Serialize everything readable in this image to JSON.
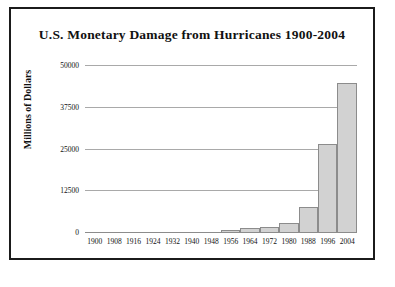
{
  "frame": {
    "border_color": "#1b1b1b",
    "background": "#ffffff"
  },
  "chart_data": {
    "type": "bar",
    "title": "U.S. Monetary Damage from Hurricanes 1900-2004",
    "xlabel": "",
    "ylabel": "Millions of Dollars",
    "ylim": [
      0,
      50000
    ],
    "yticks": [
      0,
      12500,
      25000,
      37500,
      50000
    ],
    "ytick_labels": [
      "0",
      "12500",
      "25000",
      "37500",
      "50000"
    ],
    "grid": true,
    "legend": "none",
    "bar_color": "#d2d2d2",
    "bar_edge_color": "#8c8c8c",
    "categories": [
      "1900",
      "1908",
      "1916",
      "1924",
      "1932",
      "1940",
      "1948",
      "1956",
      "1964",
      "1972",
      "1980",
      "1988",
      "1996",
      "2004"
    ],
    "values": [
      60,
      70,
      90,
      110,
      130,
      420,
      180,
      900,
      1400,
      1800,
      2900,
      7700,
      26800,
      45000
    ]
  }
}
